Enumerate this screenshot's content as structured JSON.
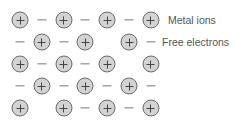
{
  "diagram": {
    "colors": {
      "ion_fill": "#d3d3d3",
      "ion_border": "#6a6a6a",
      "electron": "#777777",
      "label": "#555555"
    },
    "grid": {
      "x0": 20,
      "dx": 21.8,
      "y0": 20,
      "dy": 22,
      "rows": [
        [
          "ion",
          "e",
          "ion",
          "e",
          "ion",
          "e",
          "ion"
        ],
        [
          "e",
          "ion",
          "e",
          "ion",
          "",
          "ion",
          "e"
        ],
        [
          "ion",
          "e",
          "ion",
          "e",
          "ion",
          "",
          "ion"
        ],
        [
          "e",
          "ion",
          "e",
          "ion",
          "e",
          "ion",
          "e"
        ],
        [
          "ion",
          "",
          "ion",
          "e",
          "ion",
          "e",
          "ion"
        ]
      ]
    },
    "labels": {
      "metal_ions": "Metal ions",
      "free_electrons": "Free electrons"
    }
  }
}
